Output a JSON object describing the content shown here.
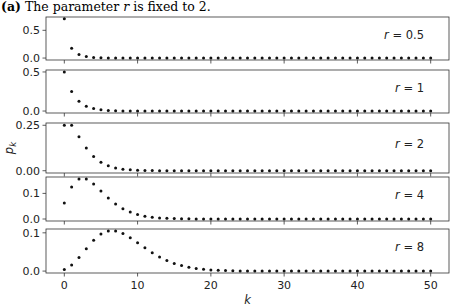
{
  "caption": {
    "label": "(a)",
    "text_before": "The parameter ",
    "variable": "r",
    "text_after": " is fixed to 2."
  },
  "chart_data": {
    "type": "scatter",
    "title": "(a) The parameter r is fixed to 2.",
    "xlabel": "k",
    "ylabel": "p_k",
    "xlim": [
      -2.5,
      52.5
    ],
    "xticks": [
      0,
      10,
      20,
      30,
      40,
      50
    ],
    "grid": false,
    "legend": "none (per-panel annotation at top right)",
    "x": [
      0,
      1,
      2,
      3,
      4,
      5,
      6,
      7,
      8,
      9,
      10,
      11,
      12,
      13,
      14,
      15,
      16,
      17,
      18,
      19,
      20,
      21,
      22,
      23,
      24,
      25,
      26,
      27,
      28,
      29,
      30,
      31,
      32,
      33,
      34,
      35,
      36,
      37,
      38,
      39,
      40,
      41,
      42,
      43,
      44,
      45,
      46,
      47,
      48,
      49,
      50
    ],
    "series": [
      {
        "name": "r = 0.5",
        "annotation": "r = 0.5",
        "ylim": [
          -0.035,
          0.74
        ],
        "yticks": [
          0.0,
          0.5
        ],
        "ytick_labels": [
          "0.0",
          "0.5"
        ],
        "values": [
          0.7071,
          0.1768,
          0.0663,
          0.0276,
          0.0121,
          0.0054,
          0.0025,
          0.0012,
          0.0005,
          0.0003,
          0.0001,
          0,
          0,
          0,
          0,
          0,
          0,
          0,
          0,
          0,
          0,
          0,
          0,
          0,
          0,
          0,
          0,
          0,
          0,
          0,
          0,
          0,
          0,
          0,
          0,
          0,
          0,
          0,
          0,
          0,
          0,
          0,
          0,
          0,
          0,
          0,
          0,
          0,
          0,
          0,
          0
        ]
      },
      {
        "name": "r = 1",
        "annotation": "r = 1",
        "ylim": [
          -0.025,
          0.525
        ],
        "yticks": [
          0.0,
          0.5
        ],
        "ytick_labels": [
          "0.0",
          "0.5"
        ],
        "values": [
          0.5,
          0.25,
          0.125,
          0.0625,
          0.0313,
          0.0156,
          0.0078,
          0.0039,
          0.002,
          0.001,
          0.0005,
          0.0002,
          0.0001,
          0,
          0,
          0,
          0,
          0,
          0,
          0,
          0,
          0,
          0,
          0,
          0,
          0,
          0,
          0,
          0,
          0,
          0,
          0,
          0,
          0,
          0,
          0,
          0,
          0,
          0,
          0,
          0,
          0,
          0,
          0,
          0,
          0,
          0,
          0,
          0,
          0,
          0
        ]
      },
      {
        "name": "r = 2",
        "annotation": "r = 2",
        "ylim": [
          -0.0125,
          0.2625
        ],
        "yticks": [
          0.0,
          0.25
        ],
        "ytick_labels": [
          "0.00",
          "0.25"
        ],
        "values": [
          0.25,
          0.25,
          0.1875,
          0.125,
          0.0781,
          0.0469,
          0.0273,
          0.0156,
          0.0088,
          0.0049,
          0.0027,
          0.0015,
          0.0008,
          0.0004,
          0.0002,
          0.0001,
          0.0001,
          0,
          0,
          0,
          0,
          0,
          0,
          0,
          0,
          0,
          0,
          0,
          0,
          0,
          0,
          0,
          0,
          0,
          0,
          0,
          0,
          0,
          0,
          0,
          0,
          0,
          0,
          0,
          0,
          0,
          0,
          0,
          0,
          0,
          0
        ]
      },
      {
        "name": "r = 4",
        "annotation": "r = 4",
        "ylim": [
          -0.0078,
          0.164
        ],
        "yticks": [
          0.0,
          0.1
        ],
        "ytick_labels": [
          "0.0",
          "0.1"
        ],
        "values": [
          0.0625,
          0.125,
          0.1563,
          0.1563,
          0.1367,
          0.1094,
          0.082,
          0.0586,
          0.0403,
          0.0269,
          0.0175,
          0.0111,
          0.0069,
          0.0043,
          0.0026,
          0.0016,
          0.0009,
          0.0006,
          0.0003,
          0.0002,
          0.0001,
          0.0001,
          0,
          0,
          0,
          0,
          0,
          0,
          0,
          0,
          0,
          0,
          0,
          0,
          0,
          0,
          0,
          0,
          0,
          0,
          0,
          0,
          0,
          0,
          0,
          0,
          0,
          0,
          0,
          0,
          0
        ]
      },
      {
        "name": "r = 8",
        "annotation": "r = 8",
        "ylim": [
          -0.005,
          0.11
        ],
        "yticks": [
          0.0,
          0.1
        ],
        "ytick_labels": [
          "0.0",
          "0.1"
        ],
        "values": [
          0.0039,
          0.0156,
          0.0352,
          0.0586,
          0.0806,
          0.0967,
          0.1047,
          0.1047,
          0.0982,
          0.0873,
          0.0742,
          0.0607,
          0.048,
          0.0369,
          0.0276,
          0.0201,
          0.0144,
          0.0101,
          0.0069,
          0.0047,
          0.0031,
          0.002,
          0.0013,
          0.0009,
          0.0005,
          0.0003,
          0.0002,
          0.0001,
          0,
          0,
          0,
          0,
          0,
          0,
          0,
          0,
          0,
          0,
          0,
          0,
          0,
          0,
          0,
          0,
          0,
          0,
          0,
          0,
          0,
          0,
          0
        ]
      }
    ]
  }
}
